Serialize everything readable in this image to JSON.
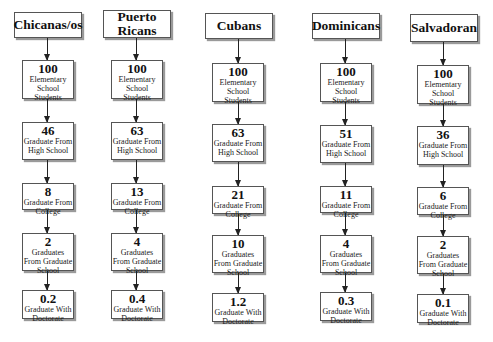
{
  "diagram": {
    "type": "parallel-flow",
    "stages": [
      "Elementary School Students",
      "Graduate From High School",
      "Graduate From College",
      "Graduates From Graduate School",
      "Graduate With Doctorate"
    ],
    "columns": [
      {
        "title": "Chicanas/os",
        "nodes": [
          {
            "value": "100",
            "label": "Elementary School Students"
          },
          {
            "value": "46",
            "label": "Graduate From High School"
          },
          {
            "value": "8",
            "label": "Graduate From College"
          },
          {
            "value": "2",
            "label": "Graduates From Graduate School"
          },
          {
            "value": "0.2",
            "label": "Graduate With Doctorate"
          }
        ]
      },
      {
        "title": "Puerto Ricans",
        "nodes": [
          {
            "value": "100",
            "label": "Elementary School Students"
          },
          {
            "value": "63",
            "label": "Graduate From High School"
          },
          {
            "value": "13",
            "label": "Graduate From College"
          },
          {
            "value": "4",
            "label": "Graduates From Graduate School"
          },
          {
            "value": "0.4",
            "label": "Graduate With Doctorate"
          }
        ]
      },
      {
        "title": "Cubans",
        "nodes": [
          {
            "value": "100",
            "label": "Elementary School Students"
          },
          {
            "value": "63",
            "label": "Graduate From High School"
          },
          {
            "value": "21",
            "label": "Graduate From College"
          },
          {
            "value": "10",
            "label": "Graduates From Graduate School"
          },
          {
            "value": "1.2",
            "label": "Graduate With Doctorate"
          }
        ]
      },
      {
        "title": "Dominicans",
        "nodes": [
          {
            "value": "100",
            "label": "Elementary School Students"
          },
          {
            "value": "51",
            "label": "Graduate From High School"
          },
          {
            "value": "11",
            "label": "Graduate From College"
          },
          {
            "value": "4",
            "label": "Graduates From Graduate School"
          },
          {
            "value": "0.3",
            "label": "Graduate With Doctorate"
          }
        ]
      },
      {
        "title": "Salvadoran",
        "nodes": [
          {
            "value": "100",
            "label": "Elementary School Students"
          },
          {
            "value": "36",
            "label": "Graduate From High School"
          },
          {
            "value": "6",
            "label": "Graduate From College"
          },
          {
            "value": "2",
            "label": "Graduates From Graduate School"
          },
          {
            "value": "0.1",
            "label": "Graduate With Doctorate"
          }
        ]
      }
    ]
  },
  "colors": {
    "box_border": "#555555",
    "box_shadow": "#9a9a9a",
    "arrow": "#222222",
    "background": "#ffffff"
  }
}
